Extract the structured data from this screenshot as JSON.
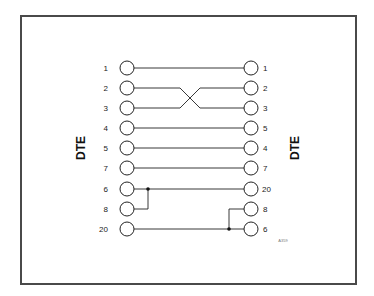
{
  "diagram": {
    "left_side_label": "DTE",
    "right_side_label": "DTE",
    "reference_code": "A359",
    "line_color": "#222222",
    "frame_color": "#4a4a4a",
    "rows": [
      {
        "left_pin": "1",
        "right_pin": "1"
      },
      {
        "left_pin": "2",
        "right_pin": "2"
      },
      {
        "left_pin": "3",
        "right_pin": "3"
      },
      {
        "left_pin": "4",
        "right_pin": "5"
      },
      {
        "left_pin": "5",
        "right_pin": "4"
      },
      {
        "left_pin": "7",
        "right_pin": "7"
      },
      {
        "left_pin": "6",
        "right_pin": "20"
      },
      {
        "left_pin": "8",
        "right_pin": "8"
      },
      {
        "left_pin": "20",
        "right_pin": "6"
      }
    ],
    "connections": [
      {
        "from": "L1",
        "to": "R1"
      },
      {
        "from": "L2",
        "to": "R3"
      },
      {
        "from": "L3",
        "to": "R2"
      },
      {
        "from": "L4",
        "to": "R5"
      },
      {
        "from": "L5",
        "to": "R4"
      },
      {
        "from": "L7",
        "to": "R7"
      },
      {
        "from": "L6",
        "to": "R20",
        "joined_with": "L8"
      },
      {
        "from": "L20",
        "to": "R6",
        "joined_with": "R8"
      }
    ]
  }
}
